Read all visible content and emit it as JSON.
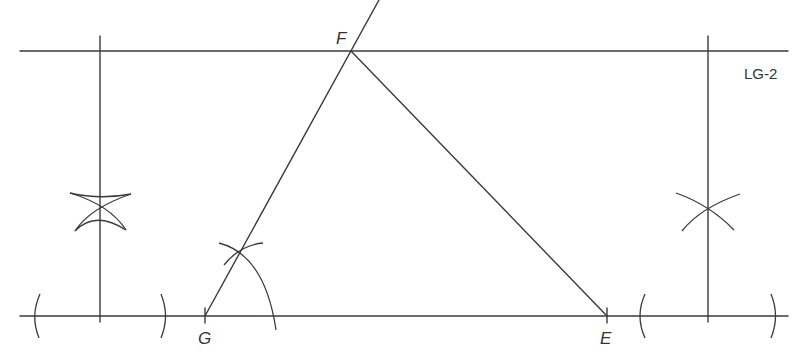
{
  "diagram": {
    "title_tag": "LG-2",
    "points": {
      "F": {
        "label": "F",
        "x": 351,
        "y": 51
      },
      "G": {
        "label": "G",
        "x": 205,
        "y": 316
      },
      "E": {
        "label": "E",
        "x": 607,
        "y": 316
      }
    },
    "lines": [
      {
        "name": "top-line",
        "from": [
          20,
          51
        ],
        "to": [
          788,
          51
        ]
      },
      {
        "name": "base-line",
        "from": [
          20,
          316
        ],
        "to": [
          788,
          316
        ]
      },
      {
        "name": "left-perpendicular",
        "from": [
          100,
          36
        ],
        "to": [
          100,
          322
        ]
      },
      {
        "name": "right-perpendicular",
        "from": [
          708,
          36
        ],
        "to": [
          708,
          322
        ]
      },
      {
        "name": "side-GF-extended",
        "from": [
          205,
          316
        ],
        "to": [
          379,
          0
        ]
      },
      {
        "name": "side-FE",
        "from": [
          351,
          51
        ],
        "to": [
          607,
          316
        ]
      }
    ],
    "construction_marks": [
      "left-bisector-arcs",
      "right-bisector-arcs",
      "left-base-arcs",
      "right-base-arcs",
      "angle-arc-at-G"
    ],
    "colors": {
      "stroke": "#3a3a3a",
      "background": "#ffffff"
    }
  }
}
